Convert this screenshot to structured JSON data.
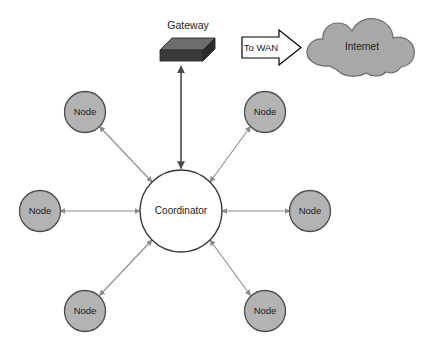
{
  "diagram": {
    "background_color": "#ffffff",
    "width": 422,
    "height": 355,
    "gateway": {
      "label": "Gateway",
      "top_face_color": "#6e6e6e",
      "front_face_color": "#3a3a3a",
      "side_face_color": "#2b2b2b"
    },
    "wan_arrow": {
      "label": "To WAN",
      "fill_color": "#ffffff",
      "stroke_color": "#000000"
    },
    "internet_cloud": {
      "label": "Internet",
      "fill_color": "#a8a8a8",
      "stroke_color": "#6b6b6b"
    },
    "coordinator": {
      "label": "Coordinator",
      "fill_color": "#ffffff",
      "stroke_color": "#3a3a3a"
    },
    "nodes": [
      {
        "label": "Node",
        "position": "top-left"
      },
      {
        "label": "Node",
        "position": "top-right"
      },
      {
        "label": "Node",
        "position": "left"
      },
      {
        "label": "Node",
        "position": "right"
      },
      {
        "label": "Node",
        "position": "bottom-left"
      },
      {
        "label": "Node",
        "position": "bottom-right"
      }
    ],
    "node_style": {
      "fill_color": "#b3b3b3",
      "stroke_color": "#4a4a4a"
    },
    "link_style": {
      "color": "#8c8c8c"
    },
    "uplink_style": {
      "color": "#4a4a4a"
    },
    "caption": ""
  }
}
